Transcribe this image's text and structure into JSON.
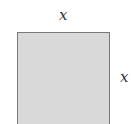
{
  "diagram": {
    "shape": "square",
    "fill_color": "#d9d9d9",
    "border_color": "#7a7a7a",
    "labels": {
      "top": "x",
      "right": "x"
    }
  }
}
